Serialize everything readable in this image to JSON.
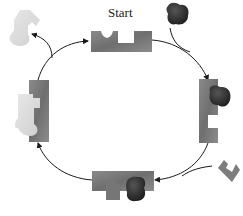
{
  "diagram": {
    "type": "cycle",
    "start_label": "Start",
    "colors": {
      "enzyme": "#7a7a7a",
      "substrate_dark": "#2e2e2e",
      "substrate_medium": "#7d7d7d",
      "product_light": "#dcdcdc",
      "arrow": "#1a1a1a",
      "background": "#ffffff"
    },
    "nodes": [
      {
        "id": "top",
        "description": "empty enzyme with two binding sites",
        "position": "top"
      },
      {
        "id": "right",
        "description": "enzyme bound to dark substrate",
        "position": "right"
      },
      {
        "id": "bottom",
        "description": "enzyme bound to dark and medium substrates",
        "position": "bottom"
      },
      {
        "id": "left",
        "description": "enzyme with combined light product",
        "position": "left"
      }
    ],
    "inputs": [
      {
        "id": "dark-substrate",
        "enters_at": "top-right"
      },
      {
        "id": "medium-substrate",
        "enters_at": "bottom-right"
      }
    ],
    "outputs": [
      {
        "id": "light-product",
        "exits_at": "top-left"
      }
    ]
  }
}
